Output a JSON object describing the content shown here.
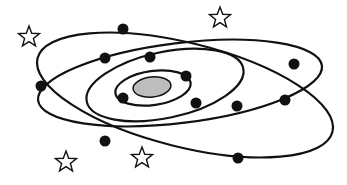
{
  "diagram": {
    "title": "",
    "colors": {
      "background": "#ffffff",
      "line": "#111111",
      "nucleus_fill": "#bdbdbd",
      "particle": "#111111",
      "star_fill": "#ffffff"
    },
    "nucleus": {
      "cx": 152,
      "cy": 87,
      "rx": 19,
      "ry": 10,
      "rotate": -6
    },
    "orbits": [
      {
        "name": "orbit-inner",
        "cx": 153,
        "cy": 88,
        "rx": 38,
        "ry": 17,
        "rotate": -8
      },
      {
        "name": "orbit-second",
        "cx": 165,
        "cy": 85,
        "rx": 80,
        "ry": 33,
        "rotate": -12
      },
      {
        "name": "orbit-third",
        "cx": 180,
        "cy": 83,
        "rx": 143,
        "ry": 40,
        "rotate": -7
      },
      {
        "name": "orbit-outer",
        "cx": 185,
        "cy": 95,
        "rx": 152,
        "ry": 52,
        "rotate": 14
      }
    ],
    "particles": [
      {
        "x": 123,
        "y": 29
      },
      {
        "x": 105,
        "y": 58
      },
      {
        "x": 150,
        "y": 57
      },
      {
        "x": 41,
        "y": 86
      },
      {
        "x": 186,
        "y": 76
      },
      {
        "x": 123,
        "y": 98
      },
      {
        "x": 196,
        "y": 103
      },
      {
        "x": 237,
        "y": 106
      },
      {
        "x": 294,
        "y": 64
      },
      {
        "x": 285,
        "y": 100
      },
      {
        "x": 105,
        "y": 141
      },
      {
        "x": 238,
        "y": 158
      }
    ],
    "stars": [
      {
        "x": 29,
        "y": 37
      },
      {
        "x": 220,
        "y": 18
      },
      {
        "x": 66,
        "y": 162
      },
      {
        "x": 142,
        "y": 158
      }
    ]
  }
}
